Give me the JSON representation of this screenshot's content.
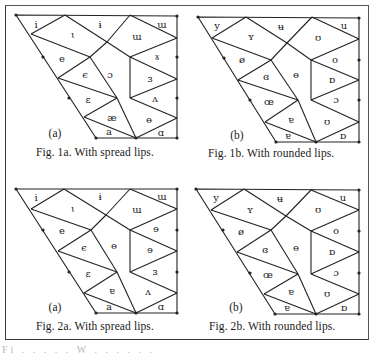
{
  "figures": [
    {
      "id": "fig1a",
      "panel_tag": "(a)",
      "caption": "Fig. 1a. With spread lips.",
      "labels": [
        "i",
        "ɨ",
        "ɯ",
        "ɩ",
        "ɯ",
        "e",
        "ɤ",
        "ϵ",
        "ɔ",
        "ɜ",
        "ɛ",
        "ʌ",
        "æ",
        "ɵ",
        "a",
        "ɑ"
      ]
    },
    {
      "id": "fig1b",
      "panel_tag": "(b)",
      "caption": "Fig. 1b. With rounded lips.",
      "labels": [
        "y",
        "ʉ",
        "u",
        "ʏ",
        "ʊ",
        "ø",
        "o",
        "ɞ",
        "ɵ",
        "ɒ",
        "œ",
        "ɔ",
        "ɐ",
        "ʊ",
        "ɐ",
        "ɒ"
      ]
    },
    {
      "id": "fig2a",
      "panel_tag": "(a)",
      "caption": "Fig. 2a. With spread lips.",
      "labels": [
        "i",
        "ɨ",
        "ɯ",
        "ɩ",
        "ɯ",
        "e",
        "ɘ",
        "ϵ",
        "ɵ",
        "ɘ",
        "ɛ",
        "ɜ",
        "ɐ",
        "ʌ",
        "a",
        "ɑ"
      ]
    },
    {
      "id": "fig2b",
      "panel_tag": "(b)",
      "caption": "Fig. 2b. With rounded lips.",
      "labels": [
        "y",
        "ʉ",
        "u",
        "ʏ",
        "ʊ",
        "ø",
        "o",
        "ɞ",
        "ɵ",
        "ɒ",
        "œ",
        "ɔ",
        "ɐ",
        "ʊ",
        "ɐ",
        "ɒ"
      ]
    }
  ],
  "footer_fragment": "Fi . . . . .   W  . . . . . ."
}
